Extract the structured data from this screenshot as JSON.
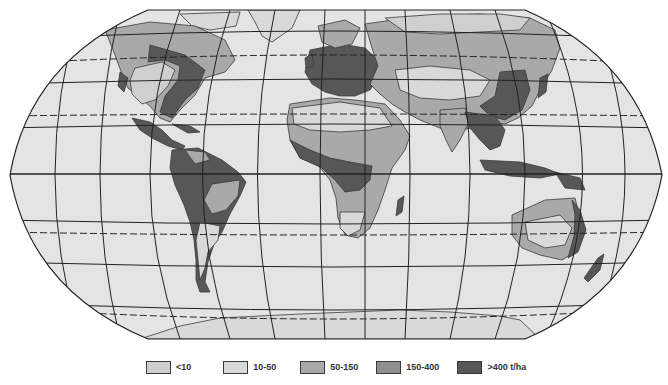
{
  "map": {
    "projection": "world-map-rounded-outline",
    "ocean_color": "#e4e4e4",
    "graticule_color": "#222222",
    "background": "#ffffff"
  },
  "legend": {
    "items": [
      {
        "label": "<10",
        "color": "#cfcfcf"
      },
      {
        "label": "10-50",
        "color": "#d9d9d9"
      },
      {
        "label": "50-150",
        "color": "#a9a9a9"
      },
      {
        "label": "150-400",
        "color": "#8e8e8e"
      },
      {
        "label": ">400 t/ha",
        "color": "#575757"
      }
    ]
  }
}
